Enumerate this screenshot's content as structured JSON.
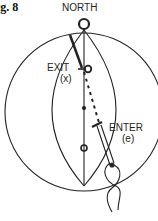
{
  "figure": {
    "label": "ig. 8",
    "labels": {
      "north": "NORTH",
      "exit": "EXIT",
      "exit_symbol": "(x)",
      "enter": "ENTER",
      "enter_symbol": "(e)"
    },
    "colors": {
      "line": "#222222",
      "background": "#ffffff"
    }
  }
}
